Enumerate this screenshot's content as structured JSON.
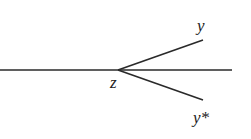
{
  "diagram": {
    "labels": {
      "z": "z",
      "y": "y",
      "y_star": "y*"
    },
    "stroke_color": "#2a2a2a",
    "points": {
      "line_start": [
        0,
        70
      ],
      "line_end": [
        232,
        70
      ],
      "z": [
        118,
        70
      ],
      "y_end": [
        203,
        40
      ],
      "y_star_end": [
        203,
        100
      ]
    }
  }
}
